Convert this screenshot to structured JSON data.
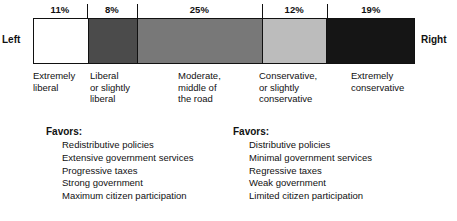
{
  "chart_data": {
    "type": "bar",
    "orientation": "horizontal-stacked",
    "title": "",
    "xlabel": "",
    "ylabel": "",
    "categories": [
      "Extremely liberal",
      "Liberal or slightly liberal",
      "Moderate, middle of the road",
      "Conservative, or slightly conservative",
      "Extremely conservative"
    ],
    "values": [
      11,
      8,
      25,
      12,
      19
    ],
    "value_labels": [
      "11%",
      "8%",
      "25%",
      "12%",
      "19%"
    ],
    "unit": "%",
    "colors": [
      "#ffffff",
      "#4b4b4b",
      "#787878",
      "#bcbcbc",
      "#151515"
    ],
    "axis_end_labels": {
      "start": "Left",
      "end": "Right"
    },
    "grid": false,
    "legend": "none"
  },
  "axis": {
    "left_label": "Left",
    "right_label": "Right"
  },
  "segments": [
    {
      "percent": "11%",
      "label_lines": [
        "Extremely",
        "liberal"
      ],
      "color": "#ffffff",
      "width_pct": 14.1,
      "label_left": 0
    },
    {
      "percent": "8%",
      "label_lines": [
        "Liberal",
        "or slightly",
        "liberal"
      ],
      "color": "#4b4b4b",
      "width_pct": 13.1,
      "label_left": 57
    },
    {
      "percent": "25%",
      "label_lines": [
        "Moderate,",
        "middle of",
        "the road"
      ],
      "color": "#787878",
      "width_pct": 32.7,
      "label_left": 145
    },
    {
      "percent": "12%",
      "label_lines": [
        "Conservative,",
        "or slightly",
        "conservative"
      ],
      "color": "#bcbcbc",
      "width_pct": 17.0,
      "label_left": 226
    },
    {
      "percent": "19%",
      "label_lines": [
        "Extremely",
        "conservative"
      ],
      "color": "#151515",
      "width_pct": 23.1,
      "label_left": 318
    }
  ],
  "favors_left": {
    "title": "Favors:",
    "items": [
      "Redistributive policies",
      "Extensive government services",
      "Progressive taxes",
      "Strong government",
      "Maximum citizen participation"
    ]
  },
  "favors_right": {
    "title": "Favors:",
    "items": [
      "Distributive policies",
      "Minimal government services",
      "Regressive taxes",
      "Weak government",
      "Limited citizen participation"
    ]
  }
}
